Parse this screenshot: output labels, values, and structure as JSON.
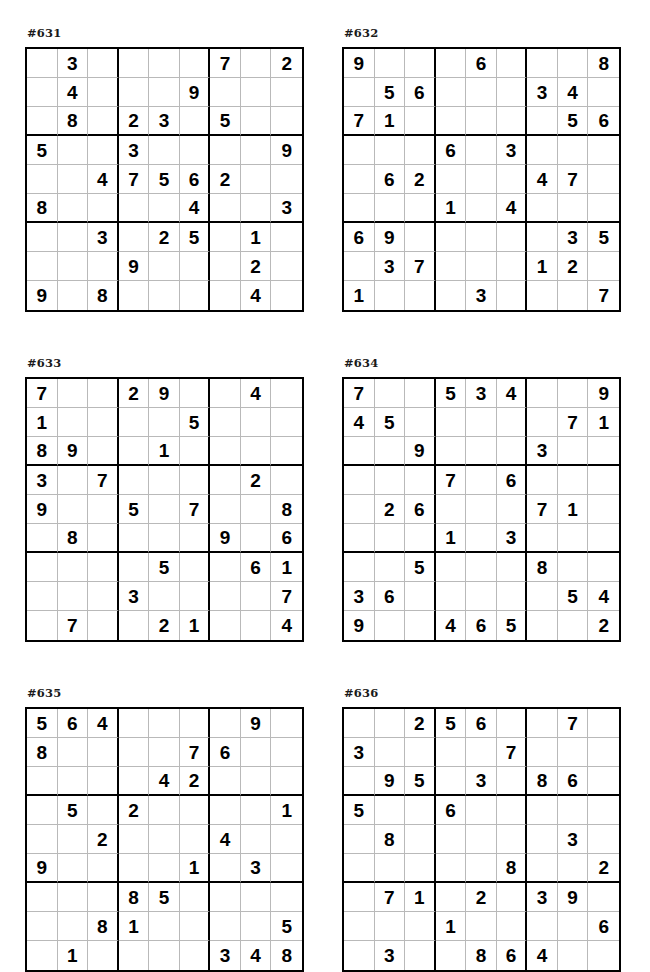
{
  "page": {
    "background_color": "#ffffff",
    "ink_color": "#000000",
    "grid_line_color": "#b9b9b9",
    "box_line_color": "#000000",
    "columns": 2,
    "rows": 3
  },
  "puzzles": [
    {
      "label": "#631",
      "id": "631",
      "grid": [
        [
          "",
          "3",
          "",
          "",
          "",
          "",
          "7",
          "",
          "2"
        ],
        [
          "",
          "4",
          "",
          "",
          "",
          "9",
          "",
          "",
          ""
        ],
        [
          "",
          "8",
          "",
          "2",
          "3",
          "",
          "5",
          "",
          ""
        ],
        [
          "5",
          "",
          "",
          "3",
          "",
          "",
          "",
          "",
          "9"
        ],
        [
          "",
          "",
          "4",
          "7",
          "5",
          "6",
          "2",
          "",
          ""
        ],
        [
          "8",
          "",
          "",
          "",
          "",
          "4",
          "",
          "",
          "3"
        ],
        [
          "",
          "",
          "3",
          "",
          "2",
          "5",
          "",
          "1",
          ""
        ],
        [
          "",
          "",
          "",
          "9",
          "",
          "",
          "",
          "2",
          ""
        ],
        [
          "9",
          "",
          "8",
          "",
          "",
          "",
          "",
          "4",
          ""
        ]
      ]
    },
    {
      "label": "#632",
      "id": "632",
      "grid": [
        [
          "9",
          "",
          "",
          "",
          "6",
          "",
          "",
          "",
          "8"
        ],
        [
          "",
          "5",
          "6",
          "",
          "",
          "",
          "3",
          "4",
          ""
        ],
        [
          "7",
          "1",
          "",
          "",
          "",
          "",
          "",
          "5",
          "6"
        ],
        [
          "",
          "",
          "",
          "6",
          "",
          "3",
          "",
          "",
          ""
        ],
        [
          "",
          "6",
          "2",
          "",
          "",
          "",
          "4",
          "7",
          ""
        ],
        [
          "",
          "",
          "",
          "1",
          "",
          "4",
          "",
          "",
          ""
        ],
        [
          "6",
          "9",
          "",
          "",
          "",
          "",
          "",
          "3",
          "5"
        ],
        [
          "",
          "3",
          "7",
          "",
          "",
          "",
          "1",
          "2",
          ""
        ],
        [
          "1",
          "",
          "",
          "",
          "3",
          "",
          "",
          "",
          "7"
        ]
      ]
    },
    {
      "label": "#633",
      "id": "633",
      "grid": [
        [
          "7",
          "",
          "",
          "2",
          "9",
          "",
          "",
          "4",
          ""
        ],
        [
          "1",
          "",
          "",
          "",
          "",
          "5",
          "",
          "",
          ""
        ],
        [
          "8",
          "9",
          "",
          "",
          "1",
          "",
          "",
          "",
          ""
        ],
        [
          "3",
          "",
          "7",
          "",
          "",
          "",
          "",
          "2",
          ""
        ],
        [
          "9",
          "",
          "",
          "5",
          "",
          "7",
          "",
          "",
          "8"
        ],
        [
          "",
          "8",
          "",
          "",
          "",
          "",
          "9",
          "",
          "6"
        ],
        [
          "",
          "",
          "",
          "",
          "5",
          "",
          "",
          "6",
          "1"
        ],
        [
          "",
          "",
          "",
          "3",
          "",
          "",
          "",
          "",
          "7"
        ],
        [
          "",
          "7",
          "",
          "",
          "2",
          "1",
          "",
          "",
          "4"
        ]
      ]
    },
    {
      "label": "#634",
      "id": "634",
      "grid": [
        [
          "7",
          "",
          "",
          "5",
          "3",
          "4",
          "",
          "",
          "9"
        ],
        [
          "4",
          "5",
          "",
          "",
          "",
          "",
          "",
          "7",
          "1"
        ],
        [
          "",
          "",
          "9",
          "",
          "",
          "",
          "3",
          "",
          ""
        ],
        [
          "",
          "",
          "",
          "7",
          "",
          "6",
          "",
          "",
          ""
        ],
        [
          "",
          "2",
          "6",
          "",
          "",
          "",
          "7",
          "1",
          ""
        ],
        [
          "",
          "",
          "",
          "1",
          "",
          "3",
          "",
          "",
          ""
        ],
        [
          "",
          "",
          "5",
          "",
          "",
          "",
          "8",
          "",
          ""
        ],
        [
          "3",
          "6",
          "",
          "",
          "",
          "",
          "",
          "5",
          "4"
        ],
        [
          "9",
          "",
          "",
          "4",
          "6",
          "5",
          "",
          "",
          "2"
        ]
      ]
    },
    {
      "label": "#635",
      "id": "635",
      "grid": [
        [
          "5",
          "6",
          "4",
          "",
          "",
          "",
          "",
          "9",
          ""
        ],
        [
          "8",
          "",
          "",
          "",
          "",
          "7",
          "6",
          "",
          ""
        ],
        [
          "",
          "",
          "",
          "",
          "4",
          "2",
          "",
          "",
          ""
        ],
        [
          "",
          "5",
          "",
          "2",
          "",
          "",
          "",
          "",
          "1"
        ],
        [
          "",
          "",
          "2",
          "",
          "",
          "",
          "4",
          "",
          ""
        ],
        [
          "9",
          "",
          "",
          "",
          "",
          "1",
          "",
          "3",
          ""
        ],
        [
          "",
          "",
          "",
          "8",
          "5",
          "",
          "",
          "",
          ""
        ],
        [
          "",
          "",
          "8",
          "1",
          "",
          "",
          "",
          "",
          "5"
        ],
        [
          "",
          "1",
          "",
          "",
          "",
          "",
          "3",
          "4",
          "8"
        ]
      ]
    },
    {
      "label": "#636",
      "id": "636",
      "grid": [
        [
          "",
          "",
          "2",
          "5",
          "6",
          "",
          "",
          "7",
          ""
        ],
        [
          "3",
          "",
          "",
          "",
          "",
          "7",
          "",
          "",
          ""
        ],
        [
          "",
          "9",
          "5",
          "",
          "3",
          "",
          "8",
          "6",
          ""
        ],
        [
          "5",
          "",
          "",
          "6",
          "",
          "",
          "",
          "",
          ""
        ],
        [
          "",
          "8",
          "",
          "",
          "",
          "",
          "",
          "3",
          ""
        ],
        [
          "",
          "",
          "",
          "",
          "",
          "8",
          "",
          "",
          "2"
        ],
        [
          "",
          "7",
          "1",
          "",
          "2",
          "",
          "3",
          "9",
          ""
        ],
        [
          "",
          "",
          "",
          "1",
          "",
          "",
          "",
          "",
          "6"
        ],
        [
          "",
          "3",
          "",
          "",
          "8",
          "6",
          "4",
          "",
          ""
        ]
      ]
    }
  ]
}
